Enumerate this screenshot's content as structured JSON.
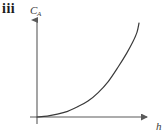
{
  "figure": {
    "panel_label": "iii",
    "background_color": "#ffffff",
    "line_color": "#3a3a3a",
    "axis_color": "#5a5a5a"
  },
  "chart_data": {
    "type": "line",
    "title": "",
    "subtitle": "",
    "xlabel": "h",
    "ylabel": "C",
    "ylabel_subscript": "A",
    "annotations": [
      "iii"
    ],
    "legend": [],
    "legend_position": "none",
    "grid": false,
    "xticks": [],
    "yticks": [],
    "xlim": [
      0,
      1
    ],
    "ylim": [
      0,
      1
    ],
    "axis_arrows": true,
    "series": [
      {
        "name": "CA vs h",
        "shape": "increasing-convex",
        "x": [
          0.0,
          0.1,
          0.2,
          0.3,
          0.4,
          0.5,
          0.6,
          0.7,
          0.8,
          0.88,
          0.94,
          0.98,
          1.0
        ],
        "y": [
          0.0,
          0.01,
          0.03,
          0.06,
          0.11,
          0.17,
          0.26,
          0.38,
          0.54,
          0.68,
          0.8,
          0.9,
          1.0
        ]
      }
    ]
  }
}
